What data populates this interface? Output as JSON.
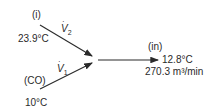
{
  "diagram": {
    "inlet_i": {
      "tag": "(i)",
      "temperature": "23.9°C",
      "flow_symbol": "V",
      "flow_sub": "2"
    },
    "inlet_co": {
      "tag": "(CO)",
      "temperature": "10°C",
      "flow_symbol": "V",
      "flow_sub": "1"
    },
    "outlet_in": {
      "tag": "(in)",
      "temperature": "12.8°C",
      "flow_rate": "270.3 m³/min"
    }
  },
  "colors": {
    "line": "#2a2a2a",
    "background": "#ffffff"
  }
}
